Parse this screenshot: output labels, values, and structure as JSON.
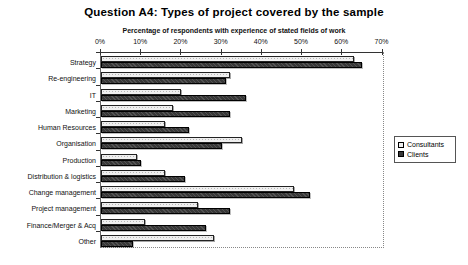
{
  "chart": {
    "title": "Question A4: Types of project covered by the sample",
    "subtitle": "Percentage of respondents with experience of stated fields of work"
  },
  "chart_data": {
    "type": "bar",
    "orientation": "horizontal",
    "title": "Question A4: Types of project covered by the sample",
    "subtitle": "Percentage of respondents with experience of stated fields of work",
    "categories": [
      "Strategy",
      "Re-engineering",
      "IT",
      "Marketing",
      "Human Resources",
      "Organisation",
      "Production",
      "Distribution & logistics",
      "Change management",
      "Project management",
      "Finance/Merger & Acq",
      "Other"
    ],
    "series": [
      {
        "name": "Consultants",
        "color": "#efefef",
        "values": [
          63,
          32,
          20,
          18,
          16,
          35,
          9,
          16,
          48,
          24,
          11,
          28
        ]
      },
      {
        "name": "Clients",
        "color": "#383838",
        "values": [
          65,
          31,
          36,
          32,
          22,
          30,
          10,
          21,
          52,
          32,
          26,
          8
        ]
      }
    ],
    "xlabel": "",
    "ylabel": "",
    "xlim": [
      0,
      70
    ],
    "x_ticks": [
      "0%",
      "10%",
      "20%",
      "30%",
      "40%",
      "50%",
      "60%",
      "70%"
    ],
    "grid": false,
    "legend_position": "right"
  }
}
